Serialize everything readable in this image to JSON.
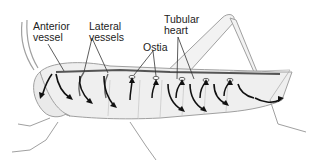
{
  "diagram": {
    "labels": {
      "anterior_vessel": [
        "Anterior",
        "vessel"
      ],
      "lateral_vessels": [
        "Lateral",
        "vessels"
      ],
      "ostia": "Ostia",
      "tubular_heart": [
        "Tubular",
        "heart"
      ]
    },
    "colors": {
      "outline": "#9a9a9a",
      "body_fill": "#efefef",
      "vessel": "#555555",
      "arrow": "#111111",
      "text": "#222222",
      "leader_line": "#333333"
    }
  }
}
